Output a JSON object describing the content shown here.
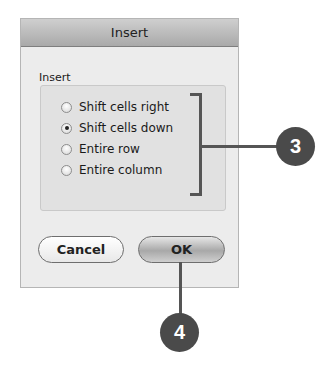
{
  "dialog": {
    "title": "Insert",
    "group_label": "Insert",
    "options": [
      {
        "label": "Shift cells right",
        "selected": false
      },
      {
        "label": "Shift cells down",
        "selected": true
      },
      {
        "label": "Entire row",
        "selected": false
      },
      {
        "label": "Entire column",
        "selected": false
      }
    ],
    "buttons": {
      "cancel": "Cancel",
      "ok": "OK"
    }
  },
  "callouts": {
    "options": "3",
    "ok": "4"
  },
  "colors": {
    "callout": "#4a4a4a",
    "dialog_bg": "#ececec"
  }
}
